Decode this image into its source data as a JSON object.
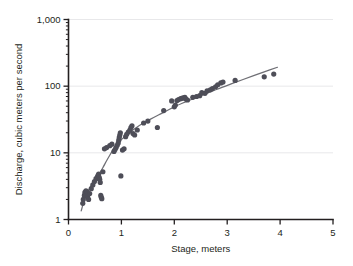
{
  "chart_data": {
    "type": "scatter",
    "title": "",
    "xlabel": "Stage, meters",
    "ylabel": "Discharge, cubic meters per second",
    "xlim": [
      0,
      5
    ],
    "ylim": [
      1,
      1000
    ],
    "yscale": "log",
    "xscale": "linear",
    "grid": "horizontal-major-only",
    "legend": "none",
    "xticks": [
      0,
      1,
      2,
      3,
      4,
      5
    ],
    "xtick_labels": [
      "0",
      "1",
      "2",
      "3",
      "4",
      "5"
    ],
    "yticks": [
      1,
      10,
      100,
      1000
    ],
    "ytick_labels": [
      "1",
      "10",
      "100",
      "1,000"
    ],
    "series": [
      {
        "name": "Stage-discharge measurements",
        "marker": "filled-circle",
        "color": "#4e4e58",
        "points": [
          [
            0.27,
            1.75
          ],
          [
            0.28,
            2.0
          ],
          [
            0.3,
            2.3
          ],
          [
            0.31,
            2.55
          ],
          [
            0.33,
            2.7
          ],
          [
            0.35,
            2.6
          ],
          [
            0.36,
            2.2
          ],
          [
            0.38,
            2.0
          ],
          [
            0.4,
            2.45
          ],
          [
            0.43,
            2.9
          ],
          [
            0.46,
            3.3
          ],
          [
            0.49,
            3.7
          ],
          [
            0.52,
            4.1
          ],
          [
            0.55,
            4.4
          ],
          [
            0.56,
            4.6
          ],
          [
            0.57,
            4.8
          ],
          [
            0.58,
            4.3
          ],
          [
            0.59,
            4.0
          ],
          [
            0.6,
            3.6
          ],
          [
            0.61,
            2.3
          ],
          [
            0.62,
            2.15
          ],
          [
            0.63,
            2.05
          ],
          [
            0.65,
            5.2
          ],
          [
            0.68,
            11.5
          ],
          [
            0.72,
            12.0
          ],
          [
            0.78,
            12.8
          ],
          [
            0.82,
            13.5
          ],
          [
            0.86,
            10.5
          ],
          [
            0.88,
            11.2
          ],
          [
            0.9,
            12.0
          ],
          [
            0.92,
            13.0
          ],
          [
            0.94,
            14.0
          ],
          [
            0.95,
            15.5
          ],
          [
            0.96,
            17.0
          ],
          [
            0.97,
            18.5
          ],
          [
            0.98,
            20.0
          ],
          [
            0.99,
            4.5
          ],
          [
            1.02,
            11.0
          ],
          [
            1.05,
            11.5
          ],
          [
            1.08,
            17.5
          ],
          [
            1.1,
            19.0
          ],
          [
            1.13,
            20.5
          ],
          [
            1.16,
            22.0
          ],
          [
            1.18,
            24.0
          ],
          [
            1.2,
            25.5
          ],
          [
            1.22,
            19.5
          ],
          [
            1.25,
            18.5
          ],
          [
            1.3,
            22.0
          ],
          [
            1.42,
            28.0
          ],
          [
            1.5,
            30.0
          ],
          [
            1.68,
            24.0
          ],
          [
            1.8,
            43.0
          ],
          [
            1.95,
            60.0
          ],
          [
            2.0,
            49.0
          ],
          [
            2.02,
            52.0
          ],
          [
            2.05,
            61.0
          ],
          [
            2.08,
            63.0
          ],
          [
            2.12,
            65.0
          ],
          [
            2.15,
            66.0
          ],
          [
            2.18,
            67.0
          ],
          [
            2.2,
            68.0
          ],
          [
            2.22,
            64.0
          ],
          [
            2.25,
            62.0
          ],
          [
            2.35,
            68.0
          ],
          [
            2.42,
            70.0
          ],
          [
            2.48,
            72.0
          ],
          [
            2.52,
            80.0
          ],
          [
            2.58,
            78.0
          ],
          [
            2.62,
            85.0
          ],
          [
            2.68,
            88.0
          ],
          [
            2.72,
            92.0
          ],
          [
            2.78,
            98.0
          ],
          [
            2.82,
            105.0
          ],
          [
            2.88,
            112.0
          ],
          [
            2.92,
            115.0
          ],
          [
            3.15,
            122.0
          ],
          [
            3.7,
            138.0
          ],
          [
            3.88,
            152.0
          ]
        ]
      }
    ],
    "trend": {
      "name": "fitted rating curve",
      "color": "#6f6f75",
      "points": [
        [
          0.24,
          1.35
        ],
        [
          0.3,
          1.95
        ],
        [
          0.36,
          2.55
        ],
        [
          0.42,
          3.15
        ],
        [
          0.48,
          3.75
        ],
        [
          0.54,
          4.35
        ],
        [
          0.6,
          5.1
        ],
        [
          0.66,
          6.2
        ],
        [
          0.72,
          7.6
        ],
        [
          0.78,
          9.2
        ],
        [
          0.84,
          11.0
        ],
        [
          0.9,
          12.8
        ],
        [
          0.96,
          14.6
        ],
        [
          1.05,
          17.2
        ],
        [
          1.15,
          20.0
        ],
        [
          1.25,
          23.0
        ],
        [
          1.4,
          27.5
        ],
        [
          1.55,
          32.0
        ],
        [
          1.7,
          37.0
        ],
        [
          1.85,
          42.5
        ],
        [
          2.0,
          49.0
        ],
        [
          2.15,
          55.5
        ],
        [
          2.3,
          62.0
        ],
        [
          2.45,
          69.0
        ],
        [
          2.6,
          77.0
        ],
        [
          2.75,
          86.0
        ],
        [
          2.9,
          96.0
        ],
        [
          3.1,
          110.0
        ],
        [
          3.3,
          126.0
        ],
        [
          3.5,
          144.0
        ],
        [
          3.7,
          164.0
        ],
        [
          3.95,
          192.0
        ]
      ]
    }
  },
  "axes": {
    "x_title": "Stage, meters",
    "y_title": "Discharge, cubic meters per second",
    "x_labels": [
      "0",
      "1",
      "2",
      "3",
      "4",
      "5"
    ],
    "y_labels": [
      "1",
      "10",
      "100",
      "1,000"
    ]
  },
  "colors": {
    "point": "#4e4e58",
    "trend": "#6f6f75",
    "axis": "#231f20",
    "grid": "#e8e8ea",
    "background": "#ffffff"
  }
}
